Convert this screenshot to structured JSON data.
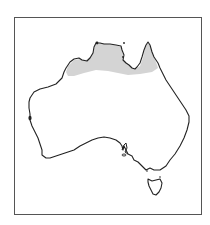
{
  "map": {
    "region": "Australia",
    "frame": {
      "border_color": "#555555",
      "background": "#ffffff"
    },
    "coastline_color": "#222222",
    "distribution": {
      "label": "shaded range",
      "fill_color": "#d4d4d4",
      "area": "Northern Australia: Kimberley, Top End, Gulf of Carpentaria to base of Cape York"
    },
    "features": [
      "mainland",
      "tasmania",
      "distribution-shading"
    ]
  }
}
